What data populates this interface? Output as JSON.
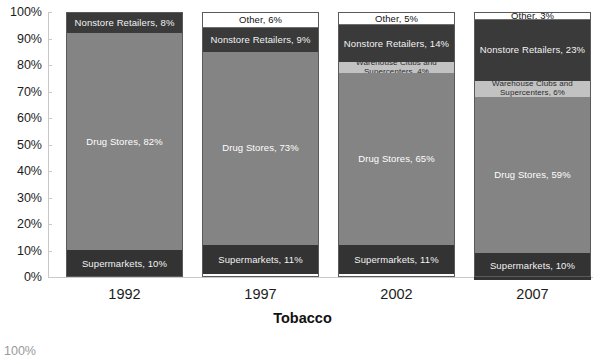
{
  "chart_data": {
    "type": "bar",
    "subtype": "100-percent-stacked-column",
    "title": "Tobacco",
    "xlabel": "",
    "ylabel": "",
    "ylim": [
      0,
      100
    ],
    "y_tick_labels": [
      "0%",
      "10%",
      "20%",
      "30%",
      "40%",
      "50%",
      "60%",
      "70%",
      "80%",
      "90%",
      "100%"
    ],
    "y_tick_values": [
      0,
      10,
      20,
      30,
      40,
      50,
      60,
      70,
      80,
      90,
      100
    ],
    "grid": false,
    "legend": "none (in-segment data labels)",
    "categories": [
      "1992",
      "1997",
      "2002",
      "2007"
    ],
    "series": [
      {
        "name": "Supermarkets",
        "values": [
          10,
          11,
          11,
          10
        ],
        "color": "#333333"
      },
      {
        "name": "Drug Stores",
        "values": [
          82,
          73,
          65,
          59
        ],
        "color": "#848484"
      },
      {
        "name": "Warehouse Clubs and Supercenters",
        "values": [
          0,
          0,
          4,
          6
        ],
        "color": "#c2c2c2"
      },
      {
        "name": "Nonstore Retailers",
        "values": [
          8,
          9,
          14,
          23
        ],
        "color": "#3a3a3a"
      },
      {
        "name": "Other",
        "values": [
          0,
          6,
          5,
          3
        ],
        "color": "#ffffff"
      }
    ]
  },
  "columns": [
    {
      "year": "1992",
      "segments": [
        {
          "key": "other",
          "label": "",
          "value": 0
        },
        {
          "key": "nonstore",
          "label": "Nonstore Retailers, 8%",
          "value": 8
        },
        {
          "key": "warehouse",
          "label": "",
          "value": 0
        },
        {
          "key": "drug",
          "label": "Drug Stores, 82%",
          "value": 82
        },
        {
          "key": "supermarkets",
          "label": "Supermarkets, 10%",
          "value": 10
        }
      ]
    },
    {
      "year": "1997",
      "segments": [
        {
          "key": "other",
          "label": "Other, 6%",
          "value": 6
        },
        {
          "key": "nonstore",
          "label": "Nonstore Retailers, 9%",
          "value": 9
        },
        {
          "key": "warehouse",
          "label": "",
          "value": 0
        },
        {
          "key": "drug",
          "label": "Drug Stores, 73%",
          "value": 73
        },
        {
          "key": "supermarkets",
          "label": "Supermarkets, 11%",
          "value": 11
        }
      ]
    },
    {
      "year": "2002",
      "segments": [
        {
          "key": "other",
          "label": "Other, 5%",
          "value": 5
        },
        {
          "key": "nonstore",
          "label": "Nonstore Retailers, 14%",
          "value": 14
        },
        {
          "key": "warehouse",
          "label": "Warehouse Clubs and Supercenters, 4%",
          "value": 4
        },
        {
          "key": "drug",
          "label": "Drug Stores, 65%",
          "value": 65
        },
        {
          "key": "supermarkets",
          "label": "Supermarkets, 11%",
          "value": 11
        }
      ]
    },
    {
      "year": "2007",
      "segments": [
        {
          "key": "other",
          "label": "Other, 3%",
          "value": 3
        },
        {
          "key": "nonstore",
          "label": "Nonstore Retailers, 23%",
          "value": 23
        },
        {
          "key": "warehouse",
          "label": "Warehouse Clubs and Supercenters, 6%",
          "value": 6
        },
        {
          "key": "drug",
          "label": "Drug Stores, 59%",
          "value": 59
        },
        {
          "key": "supermarkets",
          "label": "Supermarkets, 10%",
          "value": 10
        }
      ]
    }
  ],
  "next_chart_partial_tick": "100%",
  "colors": {
    "supermarkets": "#333333",
    "drug_stores": "#848484",
    "warehouse": "#c2c2c2",
    "nonstore": "#3a3a3a",
    "other": "#ffffff",
    "axis": "#c9c9c9",
    "text": "#1c1c1c"
  }
}
